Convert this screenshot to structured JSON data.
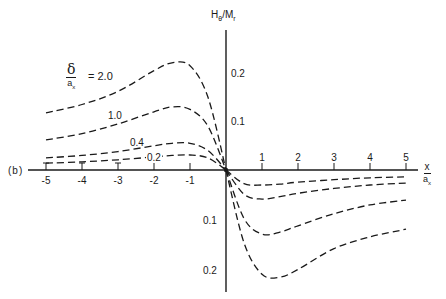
{
  "panel_label": "(b)",
  "y_axis": {
    "label_main": "H",
    "label_sub": "θ",
    "label_sep": "/M",
    "label_sub2": "r",
    "upper_ticks": [
      {
        "value": 0.2,
        "label": "0.2"
      },
      {
        "value": 0.1,
        "label": "0.1"
      }
    ],
    "lower_ticks": [
      {
        "value": -0.1,
        "label": "0.1"
      },
      {
        "value": -0.2,
        "label": "0.2"
      }
    ]
  },
  "x_axis": {
    "label_num": "x",
    "label_den": "a",
    "label_den_sub": "x",
    "ticks": [
      "-5",
      "-4",
      "-3",
      "-2",
      "-1",
      "1",
      "2",
      "3",
      "4",
      "5"
    ]
  },
  "legend": {
    "param_num": "δ",
    "param_den": "a",
    "param_den_sub": "x",
    "equals": "= 2.0",
    "labels": [
      "1.0",
      "0.4",
      "0.2"
    ]
  },
  "chart_data": {
    "type": "line",
    "title": "",
    "xlabel": "x / a_x",
    "ylabel": "H_θ / M_r",
    "xlim": [
      -5,
      5
    ],
    "ylim": [
      -0.27,
      0.29
    ],
    "grid": false,
    "line_style": "dashed",
    "legend_position": "inline labels, upper left",
    "parameter": "δ / a_x",
    "x": [
      -5,
      -4,
      -3,
      -2,
      -1.5,
      -1,
      -0.5,
      0,
      0.5,
      1,
      1.5,
      2,
      3,
      4,
      5
    ],
    "series": [
      {
        "name": "δ/a_x = 2.0",
        "values": [
          0.118,
          0.135,
          0.162,
          0.205,
          0.221,
          0.215,
          0.15,
          0.0,
          -0.15,
          -0.215,
          -0.221,
          -0.205,
          -0.162,
          -0.138,
          -0.122
        ]
      },
      {
        "name": "δ/a_x = 1.0",
        "values": [
          0.062,
          0.075,
          0.095,
          0.12,
          0.13,
          0.125,
          0.09,
          0.0,
          -0.1,
          -0.132,
          -0.128,
          -0.115,
          -0.09,
          -0.072,
          -0.062
        ]
      },
      {
        "name": "δ/a_x = 0.4",
        "values": [
          0.025,
          0.03,
          0.038,
          0.05,
          0.055,
          0.055,
          0.04,
          0.0,
          -0.05,
          -0.06,
          -0.055,
          -0.048,
          -0.038,
          -0.031,
          -0.027
        ]
      },
      {
        "name": "δ/a_x = 0.2",
        "values": [
          0.014,
          0.017,
          0.021,
          0.027,
          0.03,
          0.031,
          0.025,
          0.0,
          -0.028,
          -0.031,
          -0.029,
          -0.025,
          -0.02,
          -0.016,
          -0.014
        ]
      }
    ],
    "px_map": {
      "origin_x": 226,
      "origin_y": 170,
      "px_per_x": 36,
      "px_per_y": 485
    }
  }
}
